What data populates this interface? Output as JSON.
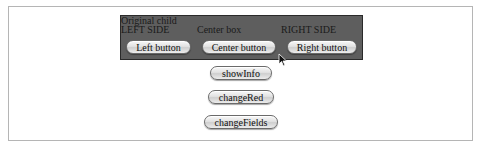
{
  "container": {
    "line1": "Original child",
    "left_label": "LEFT SIDE",
    "center_label": "Center box",
    "right_label": "RIGHT SIDE",
    "left_button": "Left button",
    "center_button": "Center button",
    "right_button": "Right button"
  },
  "actions": {
    "show_info": "showInfo",
    "change_red": "changeRed",
    "change_fields": "changeFields"
  },
  "colors": {
    "container_bg": "#5e5e5e",
    "frame_border": "#b5b5b5"
  }
}
